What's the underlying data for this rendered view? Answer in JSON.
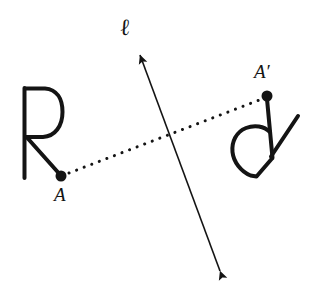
{
  "figure": {
    "background_color": "#ffffff",
    "ink_color": "#141414",
    "width": 319,
    "height": 291
  },
  "labels": {
    "point_a": "A",
    "point_a_prime": "A′",
    "line_l": "ℓ"
  },
  "geometry": {
    "mirror_line": {
      "name": "line-l",
      "arrowheads": "both",
      "top_point": [
        138,
        50
      ],
      "bottom_point": [
        222,
        276
      ],
      "stroke_width": 1.6
    },
    "connector": {
      "name": "dotted-segment-A-to-Aprime",
      "style": "dotted",
      "from": [
        61,
        176
      ],
      "to": [
        266,
        98
      ],
      "dot_radius": 1.5,
      "dot_spacing": 8
    },
    "point_a": {
      "center": [
        61,
        176
      ],
      "radius": 5.5,
      "filled": true
    },
    "point_a_prime": {
      "center": [
        267,
        96
      ],
      "radius": 5.5,
      "filled": true
    },
    "letter_r_original": {
      "stem_top": [
        24,
        88
      ],
      "stem_bottom": [
        24,
        178
      ],
      "bowl_right_extent": 62,
      "bowl_bottom": 137,
      "leg_from": [
        26,
        137
      ],
      "leg_to": [
        59,
        174
      ],
      "stroke_width": 4
    },
    "letter_r_image": {
      "stem_from": [
        267,
        99
      ],
      "stem_to": [
        272,
        158
      ],
      "loop_left_extent": 232,
      "loop_bottom": 176,
      "leg_from": [
        271,
        156
      ],
      "leg_to": [
        298,
        116
      ],
      "stroke_width": 4
    }
  }
}
